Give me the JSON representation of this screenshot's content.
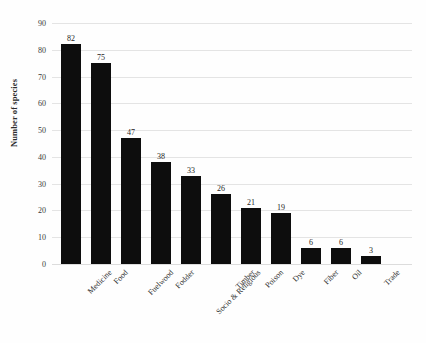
{
  "chart_data": {
    "type": "bar",
    "title": "",
    "subtitle": "",
    "xlabel": "",
    "ylabel": "Number of species",
    "categories": [
      "Medicine",
      "Food",
      "Fuelwood",
      "Fodder",
      "Socio & Religious",
      "Timber",
      "Poison",
      "Dye",
      "Fiber",
      "Oil",
      "Trade"
    ],
    "values": [
      82,
      75,
      47,
      38,
      33,
      26,
      21,
      19,
      6,
      6,
      3
    ],
    "value_labels": [
      "82",
      "75",
      "47",
      "38",
      "33",
      "26",
      "21",
      "19",
      "6",
      "6",
      "3"
    ],
    "ylim": [
      0,
      90
    ],
    "ytick_values": [
      0,
      10,
      20,
      30,
      40,
      50,
      60,
      70,
      80,
      90
    ],
    "ytick_labels": [
      "0",
      "10",
      "20",
      "30",
      "40",
      "50",
      "60",
      "70",
      "80",
      "90"
    ],
    "grid": "horizontal",
    "legend": "none",
    "bar_color": "#0d0d0d",
    "gridline_color": "#e4e4e4",
    "background_color": "#fefefe",
    "label_rotation_degrees": -45
  }
}
